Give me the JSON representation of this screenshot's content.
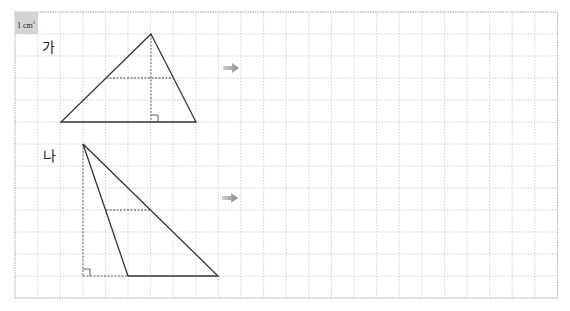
{
  "grid": {
    "left": 15,
    "top": 12,
    "cols": 24,
    "rows": 13,
    "cell_w": 22.6,
    "cell_h": 22.0,
    "line_color": "#c8c8c8",
    "border_color": "#9a9a9a"
  },
  "unit_label": {
    "value": "1 cm",
    "superscript": "2",
    "bg": "#d4d4d4"
  },
  "shapes": [
    {
      "label": "가",
      "label_pos": [
        42,
        40
      ],
      "vertices": [
        [
          151,
          34
        ],
        [
          61,
          122
        ],
        [
          196,
          122
        ]
      ],
      "midline": [
        [
          106,
          78
        ],
        [
          173,
          78
        ]
      ],
      "height_line": [
        [
          151,
          34
        ],
        [
          151,
          122
        ]
      ],
      "base_extension": null,
      "right_angle": {
        "x": 151,
        "y": 122,
        "dir": "right"
      },
      "arrow": {
        "x": 223,
        "y": 63
      }
    },
    {
      "label": "나",
      "label_pos": [
        43,
        149
      ],
      "vertices": [
        [
          83,
          144
        ],
        [
          128,
          276
        ],
        [
          218,
          276
        ]
      ],
      "midline": [
        [
          106,
          210
        ],
        [
          151,
          210
        ]
      ],
      "height_line": [
        [
          83,
          144
        ],
        [
          83,
          276
        ]
      ],
      "base_extension": [
        [
          83,
          276
        ],
        [
          128,
          276
        ]
      ],
      "right_angle": {
        "x": 83,
        "y": 276,
        "dir": "right"
      },
      "arrow": {
        "x": 222,
        "y": 193
      }
    }
  ],
  "colors": {
    "stroke": "#333333",
    "dash": "#444444",
    "arrow_light": "#d0d0d0",
    "arrow_dark": "#8a8a8a"
  }
}
